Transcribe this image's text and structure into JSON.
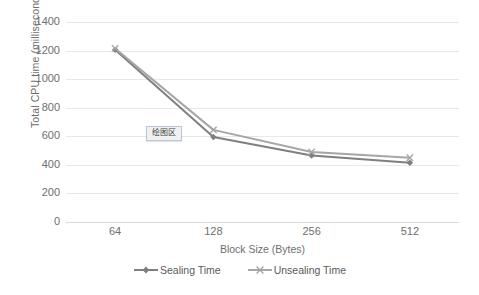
{
  "chart_data": {
    "type": "line",
    "title": "",
    "xlabel": "Block Size (Bytes)",
    "ylabel": "Total CPU time (milliseconds)",
    "categories": [
      "64",
      "128",
      "256",
      "512"
    ],
    "series": [
      {
        "name": "Sealing Time",
        "color": "#7f7f7f",
        "marker": "diamond",
        "values": [
          1205,
          595,
          465,
          415
        ]
      },
      {
        "name": "Unsealing Time",
        "color": "#a6a6a6",
        "marker": "cross",
        "values": [
          1215,
          645,
          490,
          450
        ]
      }
    ],
    "ylim": [
      0,
      1400
    ],
    "yticks": [
      1400,
      1200,
      1000,
      800,
      600,
      400,
      200,
      0
    ],
    "grid": true,
    "legend_position": "bottom"
  },
  "annotations": {
    "plot_area_tooltip": "绘图区"
  },
  "colors": {
    "gridline": "#e8e8e8",
    "axis": "#d9d9d9",
    "text": "#6e6e6e",
    "background": "#ffffff",
    "tooltip_border": "#b9c7d8",
    "tooltip_fill": "#f0f0f0"
  }
}
